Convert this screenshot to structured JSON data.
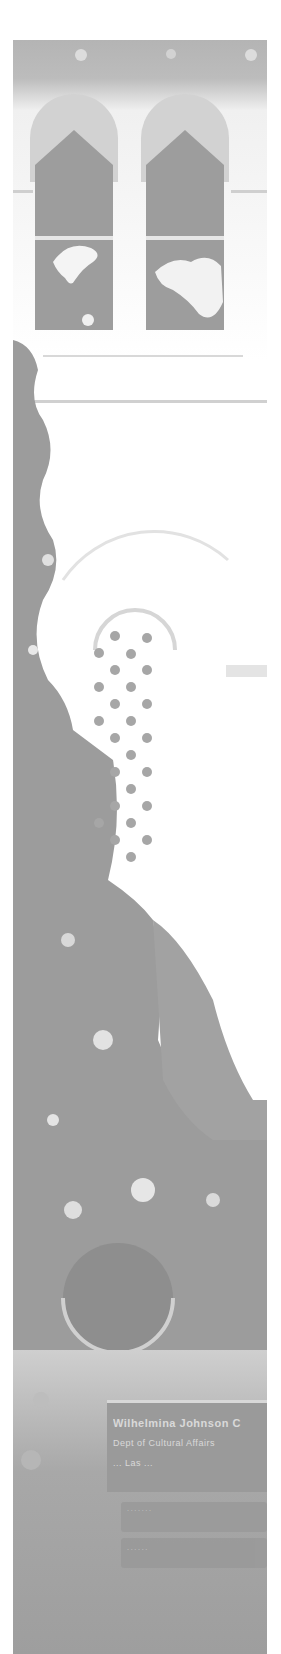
{
  "image": {
    "description": "Washed-out grayscale photograph of a stucco building facade with twin arched windows, a lattice arched window, trees, a round porthole window and an entrance sign",
    "palette": {
      "background": "#ffffff",
      "sky": "#b4b4b4",
      "window_dark": "#999999",
      "foliage": "#9c9c9c",
      "sign": "#9a9a9a",
      "sign_text": "#e4e4e4"
    }
  },
  "sign": {
    "title": "Wilhelmina Johnson C",
    "line2": "Dept of Cultural Affairs",
    "line3": "... Las ...",
    "sub_panel_1": "· · · · · · ·",
    "sub_panel_2": "· · · · · ·"
  }
}
